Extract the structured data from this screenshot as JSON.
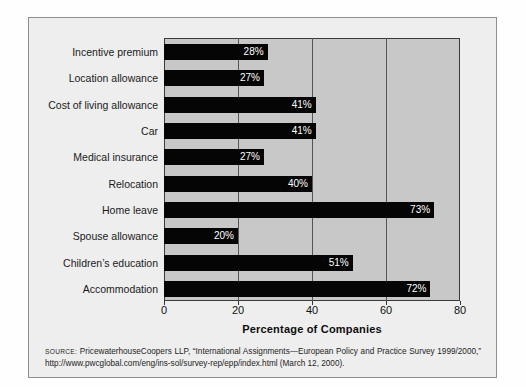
{
  "figure": {
    "source_prefix": "SOURCE:",
    "source_text": " PricewaterhouseCoopers LLP, “International Assignments—European Policy and Practice Survey 1999/2000,” http://www.pwcglobal.com/eng/ins-sol/survey-rep/epp/index.html (March 12, 2000)."
  },
  "chart_data": {
    "type": "bar",
    "orientation": "horizontal",
    "title": "",
    "xlabel": "Percentage of Companies",
    "ylabel": "",
    "xlim": [
      0,
      80
    ],
    "xticks": [
      0,
      20,
      40,
      60,
      80
    ],
    "xtick_labels": [
      "0",
      "20",
      "40",
      "60",
      "80"
    ],
    "grid": true,
    "grid_axis": "x",
    "legend": false,
    "bar_color": "#050505",
    "plot_background": "#c8c8c8",
    "value_label_suffix": "%",
    "categories": [
      "Incentive premium",
      "Location allowance",
      "Cost of living allowance",
      "Car",
      "Medical insurance",
      "Relocation",
      "Home leave",
      "Spouse allowance",
      "Children’s education",
      "Accommodation"
    ],
    "values": [
      28,
      27,
      41,
      41,
      27,
      40,
      73,
      20,
      51,
      72
    ],
    "value_labels": [
      "28%",
      "27%",
      "41%",
      "41%",
      "27%",
      "40%",
      "73%",
      "20%",
      "51%",
      "72%"
    ]
  }
}
